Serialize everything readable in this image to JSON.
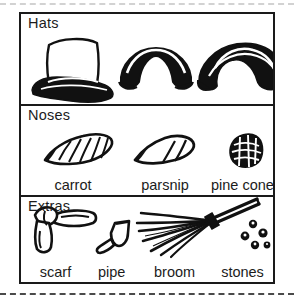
{
  "sheet": {
    "title_hint": "snowman decoration options worksheet",
    "cut_lines": 2,
    "border_color": "#1a1a1a",
    "background": "#ffffff",
    "ink_color": "#111111"
  },
  "sections": [
    {
      "key": "hats",
      "heading": "Hats",
      "items": [
        {
          "name": "top-hat",
          "label": ""
        },
        {
          "name": "bowler-hat",
          "label": ""
        },
        {
          "name": "floppy-hat",
          "label": ""
        }
      ]
    },
    {
      "key": "noses",
      "heading": "Noses",
      "items": [
        {
          "name": "carrot",
          "label": "carrot"
        },
        {
          "name": "parsnip",
          "label": "parsnip"
        },
        {
          "name": "pine-cone",
          "label": "pine cone"
        }
      ]
    },
    {
      "key": "extras",
      "heading": "Extras",
      "items": [
        {
          "name": "scarf",
          "label": "scarf"
        },
        {
          "name": "pipe",
          "label": "pipe"
        },
        {
          "name": "broom",
          "label": "broom"
        },
        {
          "name": "stones",
          "label": "stones"
        }
      ]
    }
  ]
}
